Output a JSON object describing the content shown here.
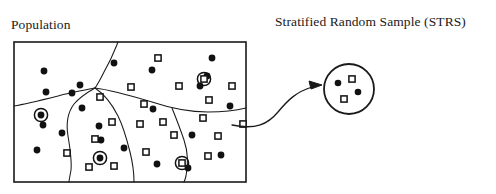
{
  "figure": {
    "type": "diagram",
    "background_color": "#ffffff",
    "ink_color": "#1a1a1a"
  },
  "labels": {
    "population": "Population",
    "sample": "Stratified Random Sample (STRS)"
  },
  "population_panel": {
    "name": "population-rectangle",
    "x": 14,
    "y": 42,
    "width": 232,
    "height": 140,
    "stroke": "#1a1a1a",
    "stroke_width": 1.6,
    "fill": "#ffffff"
  },
  "strata_boundaries": [
    {
      "name": "stratum-boundary-upper",
      "path": "M 118 42 C 114 52, 112 58, 104 72 C 100 80, 98 84, 95 88"
    },
    {
      "name": "stratum-boundary-left",
      "path": "M 95 88 C 88 92, 80 97, 74 104 C 68 112, 66 124, 68 136 C 70 148, 72 160, 71 170 C 70 176, 69 180, 69 182"
    },
    {
      "name": "stratum-boundary-west-arm",
      "path": "M 95 88 C 86 90, 72 92, 58 96 C 42 100, 26 104, 14 106"
    },
    {
      "name": "stratum-boundary-middle",
      "path": "M 95 88 C 104 94, 112 104, 118 116 C 124 128, 127 140, 130 152 C 133 164, 134 174, 134 182"
    },
    {
      "name": "stratum-boundary-east",
      "path": "M 95 88 C 112 90, 132 96, 152 102 C 170 108, 190 112, 208 112 C 224 112, 238 110, 246 108"
    },
    {
      "name": "stratum-boundary-southeast",
      "path": "M 172 108 C 176 118, 180 128, 184 140 C 188 152, 188 166, 186 176 C 185 180, 184 182, 184 182"
    }
  ],
  "population_units": {
    "dot_radius": 3.4,
    "square_size": 6.2,
    "ring_radius": 6.6,
    "dots": [
      {
        "x": 44,
        "y": 71
      },
      {
        "x": 80,
        "y": 85
      },
      {
        "x": 46,
        "y": 92
      },
      {
        "x": 72,
        "y": 93
      },
      {
        "x": 114,
        "y": 63
      },
      {
        "x": 152,
        "y": 70
      },
      {
        "x": 212,
        "y": 58
      },
      {
        "x": 153,
        "y": 109
      },
      {
        "x": 200,
        "y": 86
      },
      {
        "x": 230,
        "y": 106
      },
      {
        "x": 99,
        "y": 126
      },
      {
        "x": 82,
        "y": 108
      },
      {
        "x": 43,
        "y": 125
      },
      {
        "x": 62,
        "y": 133
      },
      {
        "x": 101,
        "y": 140
      },
      {
        "x": 37,
        "y": 150
      },
      {
        "x": 124,
        "y": 148
      },
      {
        "x": 157,
        "y": 164
      },
      {
        "x": 192,
        "y": 135
      },
      {
        "x": 221,
        "y": 155
      },
      {
        "x": 207,
        "y": 76
      },
      {
        "x": 188,
        "y": 168
      }
    ],
    "squares": [
      {
        "x": 158,
        "y": 58
      },
      {
        "x": 131,
        "y": 87
      },
      {
        "x": 179,
        "y": 86
      },
      {
        "x": 232,
        "y": 86
      },
      {
        "x": 144,
        "y": 104
      },
      {
        "x": 100,
        "y": 97
      },
      {
        "x": 112,
        "y": 122
      },
      {
        "x": 140,
        "y": 124
      },
      {
        "x": 163,
        "y": 122
      },
      {
        "x": 203,
        "y": 118
      },
      {
        "x": 243,
        "y": 124
      },
      {
        "x": 174,
        "y": 135
      },
      {
        "x": 218,
        "y": 136
      },
      {
        "x": 95,
        "y": 139
      },
      {
        "x": 67,
        "y": 153
      },
      {
        "x": 208,
        "y": 156
      },
      {
        "x": 146,
        "y": 152
      },
      {
        "x": 114,
        "y": 166
      },
      {
        "x": 89,
        "y": 167
      },
      {
        "x": 209,
        "y": 100
      }
    ],
    "selected_dots": [
      {
        "x": 41,
        "y": 115
      },
      {
        "x": 100,
        "y": 158
      }
    ],
    "selected_squares": [
      {
        "x": 204,
        "y": 79
      },
      {
        "x": 182,
        "y": 163
      }
    ]
  },
  "connector": {
    "name": "sample-arrow",
    "path": "M 232 125 C 256 130, 268 124, 278 112 C 288 100, 296 92, 312 87",
    "arrowhead": "M 322 85 L 309 81 L 311 89 Z"
  },
  "sample_circle": {
    "name": "sample-circle",
    "cx": 349,
    "cy": 89,
    "r": 25,
    "stroke": "#1a1a1a",
    "stroke_width": 1.8,
    "fill": "#ffffff",
    "dots": [
      {
        "x": 338,
        "y": 83
      },
      {
        "x": 358,
        "y": 92
      }
    ],
    "squares": [
      {
        "x": 352,
        "y": 79
      },
      {
        "x": 344,
        "y": 99
      }
    ],
    "dot_radius": 3.3,
    "square_size": 6.2
  }
}
